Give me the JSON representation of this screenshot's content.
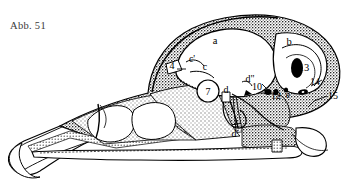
{
  "figure": {
    "caption": "Abb. 51",
    "colors": {
      "ink": "#000000",
      "paper": "#ffffff",
      "caption_ink": "#3a3a3a",
      "light_stipple": "#d8d8d8",
      "dark_stipple": "#4a4a4a",
      "cavity_fill": "#ffffff"
    }
  },
  "labels": [
    {
      "id": "label-a",
      "text": "a",
      "x": 215,
      "y": 44,
      "size": "b"
    },
    {
      "id": "label-b",
      "text": "b",
      "x": 289,
      "y": 45,
      "size": "b"
    },
    {
      "id": "label-c-prime",
      "text": "c'",
      "x": 192,
      "y": 62,
      "size": "n"
    },
    {
      "id": "label-c",
      "text": "c",
      "x": 205,
      "y": 70,
      "size": "n"
    },
    {
      "id": "label-4",
      "text": "4",
      "x": 172,
      "y": 69,
      "size": "n"
    },
    {
      "id": "label-7",
      "text": "7",
      "x": 208,
      "y": 94,
      "size": "n"
    },
    {
      "id": "label-d",
      "text": "d",
      "x": 224,
      "y": 90,
      "size": "n"
    },
    {
      "id": "label-d-dprime",
      "text": "d\"",
      "x": 250,
      "y": 82,
      "size": "n"
    },
    {
      "id": "label-10",
      "text": "10",
      "x": 256,
      "y": 89,
      "size": "n"
    },
    {
      "id": "label-13",
      "text": "13",
      "x": 302,
      "y": 68,
      "size": "b"
    },
    {
      "id": "label-12",
      "text": "12",
      "x": 276,
      "y": 98,
      "size": "n"
    },
    {
      "id": "label-e",
      "text": "e",
      "x": 288,
      "y": 97,
      "size": "n"
    },
    {
      "id": "label-14",
      "text": "14",
      "x": 313,
      "y": 89,
      "size": "n"
    },
    {
      "id": "label-15",
      "text": "15",
      "x": 330,
      "y": 99,
      "size": "n"
    },
    {
      "id": "label-d-prime",
      "text": "d'",
      "x": 235,
      "y": 135,
      "size": "n"
    }
  ]
}
